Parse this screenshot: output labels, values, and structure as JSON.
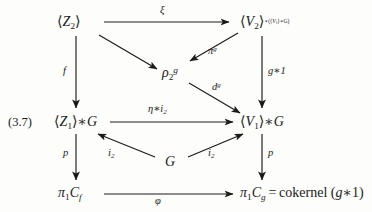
{
  "diagram": {
    "equation_number": "(3.7)",
    "nodes": {
      "top_left": "⟨Z₂⟩",
      "top_right_base": "⟨V₂⟩",
      "top_right_sup": "*(⟨V₁⟩*G)",
      "center": "ρ₂ᵍ",
      "mid_left": "⟨Z₁⟩*G",
      "mid_right": "⟨V₁⟩*G",
      "center_low": "G",
      "bottom_left": "π₁C_f",
      "bottom_right": "π₁C_g = cokernel (g*1)"
    },
    "edges": [
      {
        "name": "xi",
        "label": "ξ",
        "from": "top_left",
        "to": "top_right"
      },
      {
        "name": "pi-g",
        "label": "πᵍ",
        "from": "top_right",
        "to": "center"
      },
      {
        "name": "rho-in",
        "label": "",
        "from": "top_left",
        "to": "center"
      },
      {
        "name": "d-g",
        "label": "dᵍ",
        "from": "center",
        "to": "mid_right"
      },
      {
        "name": "f",
        "label": "f",
        "from": "top_left",
        "to": "mid_left"
      },
      {
        "name": "g-star-1",
        "label": "g*1",
        "from": "top_right",
        "to": "mid_right"
      },
      {
        "name": "eta-star-i2",
        "label": "η*i₂",
        "from": "mid_left",
        "to": "mid_right"
      },
      {
        "name": "i2-left",
        "label": "i₂",
        "from": "center_low",
        "to": "mid_left"
      },
      {
        "name": "i2-right",
        "label": "i₂",
        "from": "center_low",
        "to": "mid_right"
      },
      {
        "name": "p-left",
        "label": "p",
        "from": "mid_left",
        "to": "bottom_left"
      },
      {
        "name": "p-right",
        "label": "p",
        "from": "mid_right",
        "to": "bottom_right"
      },
      {
        "name": "phi",
        "label": "φ",
        "from": "bottom_left",
        "to": "bottom_right"
      }
    ],
    "colors": {
      "ink": "#1a1a1a",
      "paper": "#fdfdfb"
    }
  }
}
